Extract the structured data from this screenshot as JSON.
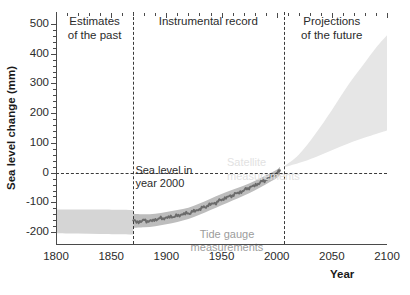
{
  "chart_data": {
    "type": "area",
    "title": "",
    "xlabel": "Year",
    "ylabel": "Sea level change (mm)",
    "xlim": [
      1800,
      2100
    ],
    "ylim": [
      -240,
      540
    ],
    "xticks": [
      1800,
      1850,
      1900,
      1950,
      2000,
      2050,
      2100
    ],
    "xtick_labels": [
      "1800",
      "1850",
      "1900",
      "1950",
      "2000",
      "2050",
      "2100"
    ],
    "xtick_minor_step": 10,
    "yticks": [
      -200,
      -100,
      0,
      100,
      200,
      300,
      400,
      500
    ],
    "ytick_labels": [
      "-200",
      "-100",
      "0",
      "100",
      "200",
      "300",
      "400",
      "500"
    ],
    "ytick_minor_step": 20,
    "grid": false,
    "legend_position": "inline-annotations",
    "reference_lines": [
      {
        "name": "zero-sea-level",
        "orientation": "horizontal",
        "value": 0,
        "style": "dashed",
        "label": "Sea level in year 2000"
      },
      {
        "name": "instrumental-record-start",
        "orientation": "vertical",
        "value": 1870,
        "style": "dashed"
      },
      {
        "name": "projection-start",
        "orientation": "vertical",
        "value": 2007,
        "style": "dashed"
      }
    ],
    "regions": [
      {
        "name": "estimates-of-the-past",
        "label_line1": "Estimates",
        "label_line2": "of the past",
        "x_center": 1835
      },
      {
        "name": "instrumental-record",
        "label_line1": "Instrumental record",
        "label_line2": "",
        "x_center": 1938
      },
      {
        "name": "projections-of-the-future",
        "label_line1": "Projections",
        "label_line2": "of the future",
        "x_center": 2050
      }
    ],
    "annotations": [
      {
        "name": "sea-level-year-2000",
        "line1": "Sea level in",
        "line2": "year 2000",
        "x": 1872,
        "y": 30,
        "color": "#2b2b2b"
      },
      {
        "name": "tide-gauge-measurements",
        "line1": "Tide gauge",
        "line2": "measurements",
        "x": 1955,
        "y": -185,
        "color": "#9c9c9c"
      },
      {
        "name": "satellite-measurements",
        "line1": "Satellite",
        "line2": "measurements",
        "x": 1988,
        "y": 55,
        "color": "#e2e2e2"
      }
    ],
    "series": [
      {
        "name": "proxy-estimates-band",
        "label": "Estimates of the past (uncertainty band)",
        "kind": "band",
        "fill": "#d5d5d5",
        "x": [
          1800,
          1820,
          1840,
          1860,
          1870
        ],
        "upper": [
          -124,
          -124,
          -124,
          -125,
          -126
        ],
        "lower": [
          -204,
          -205,
          -206,
          -207,
          -208
        ]
      },
      {
        "name": "tide-gauge-band",
        "label": "Tide gauge measurements (uncertainty band)",
        "kind": "band",
        "fill": "#bdbdbd",
        "x": [
          1870,
          1880,
          1890,
          1900,
          1910,
          1920,
          1930,
          1940,
          1950,
          1960,
          1970,
          1980,
          1990,
          2000,
          2003
        ],
        "upper": [
          -138,
          -140,
          -138,
          -132,
          -126,
          -118,
          -104,
          -88,
          -72,
          -58,
          -44,
          -28,
          -10,
          10,
          20
        ],
        "lower": [
          -186,
          -184,
          -180,
          -174,
          -166,
          -156,
          -142,
          -126,
          -110,
          -94,
          -78,
          -60,
          -40,
          -18,
          -8
        ]
      },
      {
        "name": "tide-gauge-line",
        "label": "Tide gauge measurements",
        "kind": "line",
        "color": "#6b6b6b",
        "x": [
          1870,
          1875,
          1880,
          1885,
          1890,
          1895,
          1900,
          1905,
          1910,
          1915,
          1920,
          1925,
          1930,
          1935,
          1940,
          1945,
          1950,
          1955,
          1960,
          1965,
          1970,
          1975,
          1980,
          1985,
          1990,
          1995,
          2000,
          2003
        ],
        "values": [
          -162,
          -166,
          -160,
          -164,
          -158,
          -154,
          -152,
          -148,
          -146,
          -139,
          -137,
          -130,
          -123,
          -115,
          -107,
          -101,
          -91,
          -83,
          -76,
          -68,
          -61,
          -50,
          -44,
          -33,
          -25,
          -12,
          -3,
          8
        ]
      },
      {
        "name": "projection-cone",
        "label": "Projections of the future (range)",
        "kind": "band",
        "fill": "#e6e6e6",
        "x": [
          2007,
          2020,
          2035,
          2050,
          2065,
          2080,
          2090,
          2100
        ],
        "upper": [
          22,
          60,
          130,
          210,
          295,
          370,
          420,
          462
        ],
        "lower": [
          18,
          32,
          52,
          75,
          98,
          118,
          130,
          142
        ]
      }
    ]
  },
  "caption": ""
}
